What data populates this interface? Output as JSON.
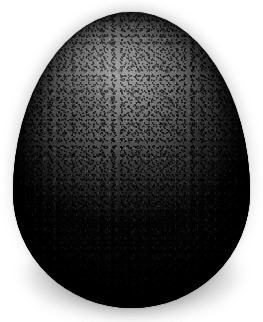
{
  "scene": {
    "title": "Dark speckled egg on white background",
    "width": 263,
    "height": 322,
    "background_color": "#ffffff",
    "subject": "egg",
    "alt_text": "A dark gray, heavily speckled egg standing upright, centered on a plain white background with a soft drop shadow beneath it."
  },
  "egg": {
    "label": "speckled-egg",
    "orientation": "upright, narrow end up",
    "surface": "matte, finely speckled shell",
    "bounds": {
      "left": 13,
      "top": 12,
      "width": 237,
      "height": 296
    },
    "colors": {
      "highlight": "#8a8a8a",
      "midtone": "#5e5e5e",
      "body": "#3b3b3b",
      "shadow": "#1a1a1a",
      "deep_shadow": "#070707",
      "speckle": "#000000"
    },
    "lighting": {
      "direction": "upper-left",
      "highlight_position": "44% 19%",
      "falloff": "darkens toward lower edge and right rim"
    }
  },
  "shadow": {
    "label": "drop-shadow",
    "color": "#000000",
    "opacity": 0.55,
    "bounds": {
      "left": 26,
      "top": 232,
      "width": 212,
      "height": 86
    }
  }
}
